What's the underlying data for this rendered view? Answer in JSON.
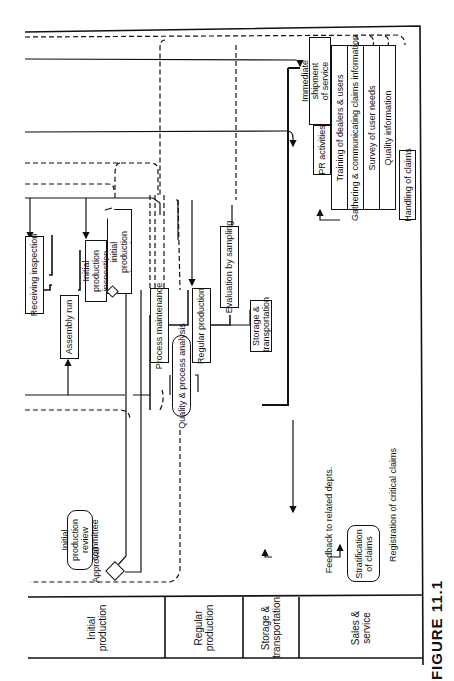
{
  "figure": {
    "caption": "FIGURE 11.1"
  },
  "lanes": [
    {
      "id": "initial",
      "label": "Initial production"
    },
    {
      "id": "regular",
      "label": "Regular production"
    },
    {
      "id": "storage",
      "label": "Storage & transportation"
    },
    {
      "id": "sales",
      "label": "Sales & service"
    }
  ],
  "nodes": {
    "receiving_inspection": "Receiving inspection",
    "assembly_run": "Assembly run",
    "initial_production_inspection": "Initial production inspection",
    "report_initial_inspection": "Report on initial production inspection",
    "review_committee": "Initial production review committee",
    "approval": "Approval",
    "process_maintenance": "Process maintenance",
    "quality_process_analysis": "Quality & process analysis",
    "regular_production": "Regular production",
    "evaluation_sampling": "Evaluation by sampling",
    "storage_transportation": "Storage & transportation",
    "pr_activities": "PR activities",
    "immediate_shipment": "Immediate shipment of service parts",
    "training_dealers": "Training of dealers & users",
    "gathering_claims": "Gathering & communicating claims information",
    "survey_user_needs": "Survey of user needs",
    "quality_information": "Quality information",
    "handling_claims": "Handling of claims",
    "stratification_claims": "Stratification of claims",
    "feedback_depts": "Feedback to related depts.",
    "registration_critical": "Registration of critical claims"
  }
}
